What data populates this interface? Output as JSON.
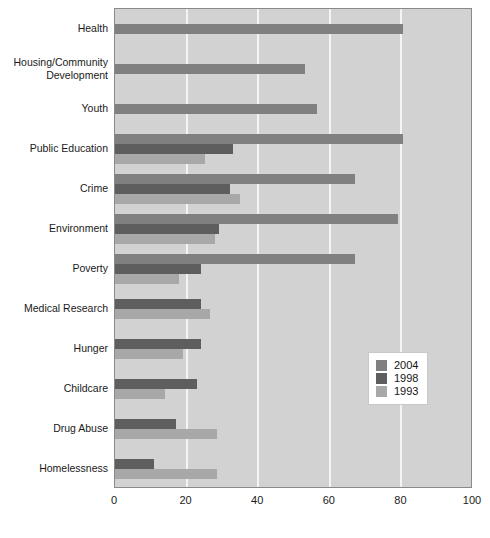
{
  "chart_data": {
    "type": "bar",
    "orientation": "horizontal",
    "title": "",
    "subtitle": "",
    "xlabel": "",
    "ylabel": "",
    "xlim": [
      0,
      100
    ],
    "xticks": [
      0,
      20,
      40,
      60,
      80,
      100
    ],
    "grid": true,
    "grid_axis": "x",
    "legend_position": "center-right",
    "categories": [
      "Health",
      "Housing/Community\nDevelopment",
      "Youth",
      "Public Education",
      "Crime",
      "Environment",
      "Poverty",
      "Medical Research",
      "Hunger",
      "Childcare",
      "Drug Abuse",
      "Homelessness"
    ],
    "series": [
      {
        "name": "2004",
        "color": "#808080",
        "values": [
          80.5,
          53.0,
          56.5,
          80.5,
          67.0,
          79.0,
          67.0,
          null,
          null,
          null,
          null,
          null
        ]
      },
      {
        "name": "1998",
        "color": "#5e5e5e",
        "values": [
          null,
          null,
          null,
          33.0,
          32.0,
          29.0,
          24.0,
          24.0,
          24.0,
          23.0,
          17.0,
          11.0
        ]
      },
      {
        "name": "1993",
        "color": "#a8a8a8",
        "values": [
          null,
          null,
          null,
          25.0,
          35.0,
          28.0,
          18.0,
          26.5,
          19.0,
          14.0,
          28.5,
          28.5
        ]
      }
    ],
    "colors": {
      "plot_background": "#d2d2d2",
      "gridline": "#f4f4f4",
      "axis": "#8a8a8a",
      "page_background": "#ffffff",
      "text": "#1a1a1a"
    }
  },
  "legend": {
    "entries": [
      {
        "label": "2004",
        "color": "#808080"
      },
      {
        "label": "1998",
        "color": "#5e5e5e"
      },
      {
        "label": "1993",
        "color": "#a8a8a8"
      }
    ]
  }
}
